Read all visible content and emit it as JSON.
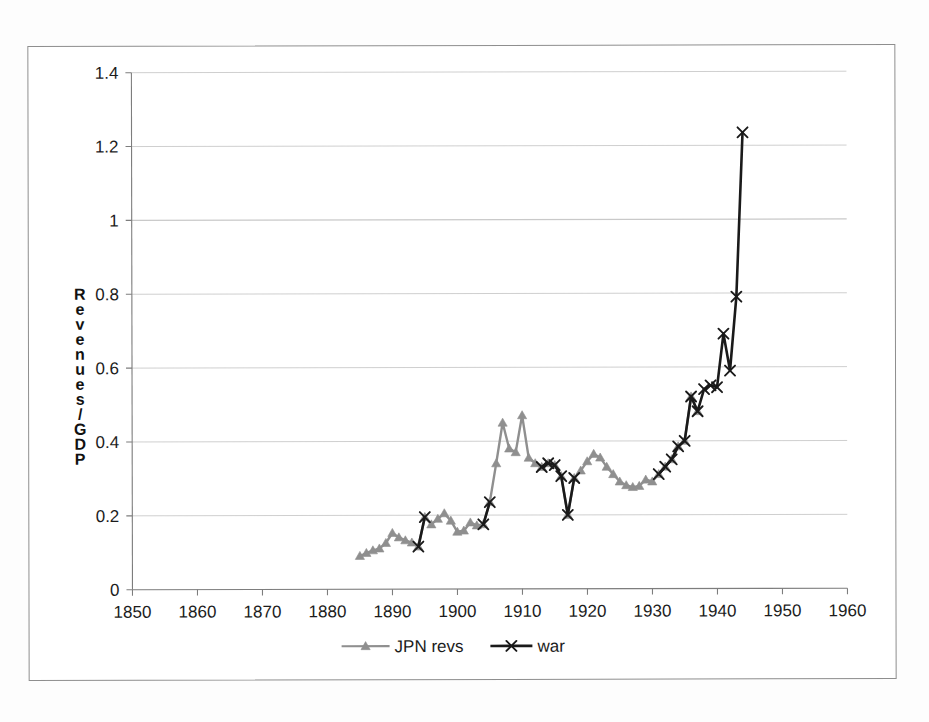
{
  "figure": {
    "frame": "scanned-page-border"
  },
  "chart_data": {
    "type": "line",
    "title": "",
    "subtitle": "",
    "xlabel": "",
    "ylabel": "Revenues/GDP",
    "ylabel_letters": [
      "R",
      "e",
      "v",
      "e",
      "n",
      "u",
      "e",
      "s",
      "/",
      "G",
      "D",
      "P"
    ],
    "xlim": [
      1850,
      1960
    ],
    "ylim": [
      0,
      1.4
    ],
    "x_ticks": [
      1850,
      1860,
      1870,
      1880,
      1890,
      1900,
      1910,
      1920,
      1930,
      1940,
      1950,
      1960
    ],
    "x_tick_labels": [
      "1850",
      "1860",
      "1870",
      "1880",
      "1890",
      "1900",
      "1910",
      "1920",
      "1930",
      "1940",
      "1950",
      "1960"
    ],
    "y_ticks": [
      0,
      0.2,
      0.4,
      0.6,
      0.8,
      1,
      1.2,
      1.4
    ],
    "y_tick_labels": [
      "0",
      "0.2",
      "0.4",
      "0.6",
      "0.8",
      "1",
      "1.2",
      "1.4"
    ],
    "grid": "horizontal",
    "legend_position": "bottom",
    "series": [
      {
        "name": "JPN revs",
        "color": "#8f8f8f",
        "marker": "triangle",
        "x": [
          1885,
          1886,
          1887,
          1888,
          1889,
          1890,
          1891,
          1892,
          1893,
          1894,
          1895,
          1896,
          1897,
          1898,
          1899,
          1900,
          1901,
          1902,
          1903,
          1904,
          1905,
          1906,
          1907,
          1908,
          1909,
          1910,
          1911,
          1912,
          1913,
          1914,
          1915,
          1916,
          1917,
          1918,
          1919,
          1920,
          1921,
          1922,
          1923,
          1924,
          1925,
          1926,
          1927,
          1928,
          1929,
          1930,
          1931,
          1932,
          1933,
          1934,
          1935,
          1936,
          1937
        ],
        "values": [
          0.09,
          0.098,
          0.105,
          0.11,
          0.125,
          0.152,
          0.14,
          0.132,
          0.126,
          0.115,
          0.195,
          0.175,
          0.19,
          0.205,
          0.185,
          0.155,
          0.158,
          0.18,
          0.172,
          0.175,
          0.235,
          0.34,
          0.45,
          0.38,
          0.37,
          0.47,
          0.355,
          0.34,
          0.33,
          0.34,
          0.335,
          0.305,
          0.2,
          0.3,
          0.32,
          0.345,
          0.365,
          0.355,
          0.33,
          0.31,
          0.29,
          0.28,
          0.275,
          0.278,
          0.295,
          0.29,
          0.31,
          0.33,
          0.35,
          0.385,
          0.4,
          0.52,
          0.48
        ]
      },
      {
        "name": "war",
        "color": "#1a1a1a",
        "marker": "x",
        "segments": [
          {
            "x": [
              1894,
              1895
            ],
            "values": [
              0.115,
              0.195
            ]
          },
          {
            "x": [
              1904,
              1905
            ],
            "values": [
              0.175,
              0.235
            ]
          },
          {
            "x": [
              1913,
              1914,
              1915,
              1916,
              1917,
              1918
            ],
            "values": [
              0.33,
              0.34,
              0.335,
              0.305,
              0.2,
              0.3
            ]
          },
          {
            "x": [
              1931,
              1932,
              1933,
              1934,
              1935,
              1936,
              1937,
              1938,
              1939,
              1940,
              1941,
              1942,
              1943,
              1944
            ],
            "values": [
              0.31,
              0.33,
              0.35,
              0.385,
              0.4,
              0.52,
              0.48,
              0.54,
              0.55,
              0.545,
              0.69,
              0.59,
              0.79,
              1.235
            ]
          }
        ]
      }
    ]
  },
  "legend": {
    "items": [
      {
        "label": "JPN revs",
        "color": "#8f8f8f",
        "marker": "triangle"
      },
      {
        "label": "war",
        "color": "#1a1a1a",
        "marker": "x"
      }
    ]
  }
}
